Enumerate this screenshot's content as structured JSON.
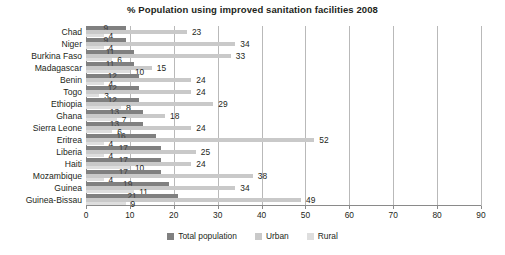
{
  "chart_data": {
    "type": "bar",
    "orientation": "horizontal",
    "title": "% Population using improved sanitation facilities 2008",
    "xlabel": "",
    "ylabel": "",
    "xlim": [
      0,
      90
    ],
    "xticks": [
      0,
      10,
      20,
      30,
      40,
      50,
      60,
      70,
      80,
      90
    ],
    "grid": true,
    "grid_axis": "x",
    "legend_position": "bottom",
    "categories": [
      "Chad",
      "Niger",
      "Burkina Faso",
      "Madagascar",
      "Benin",
      "Togo",
      "Ethiopia",
      "Ghana",
      "Sierra Leone",
      "Eritrea",
      "Liberia",
      "Haiti",
      "Mozambique",
      "Guinea",
      "Guinea-Bissau"
    ],
    "series": [
      {
        "name": "Total population",
        "color": "#808080",
        "values": [
          9,
          9,
          11,
          11,
          12,
          12,
          12,
          13,
          13,
          16,
          17,
          17,
          17,
          19,
          21
        ]
      },
      {
        "name": "Urban",
        "color": "#c9c9c9",
        "values": [
          23,
          34,
          33,
          15,
          24,
          24,
          29,
          18,
          24,
          52,
          25,
          24,
          38,
          34,
          49
        ]
      },
      {
        "name": "Rural",
        "color": "#dedede",
        "values": [
          4,
          4,
          6,
          10,
          4,
          3,
          8,
          7,
          6,
          4,
          4,
          10,
          4,
          11,
          9
        ]
      }
    ]
  },
  "colors": {
    "total_population": "#808080",
    "urban": "#c9c9c9",
    "rural": "#dedede",
    "axis": "#8a8a8a",
    "gridline": "#b9b9b9",
    "text": "#231f20",
    "background": "#ffffff"
  }
}
